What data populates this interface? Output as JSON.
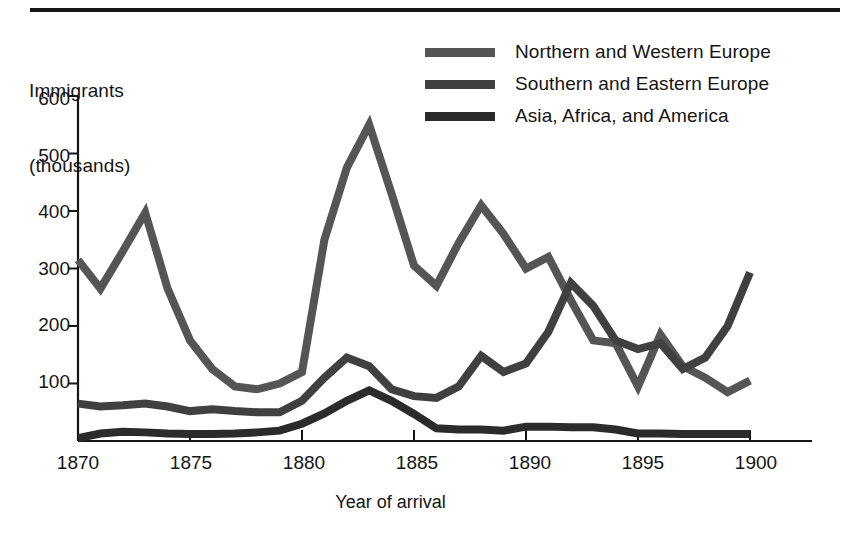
{
  "figure": {
    "y_axis_title_line1": "Immigrants",
    "y_axis_title_line2": "(thousands)",
    "x_axis_title": "Year of arrival",
    "ink_color": "#303030",
    "axis_color": "#151515"
  },
  "legend": {
    "position": "top-right",
    "entries": [
      {
        "label": "Northern and Western Europe",
        "color": "#555555"
      },
      {
        "label": "Southern and Eastern Europe",
        "color": "#404040"
      },
      {
        "label": "Asia, Africa, and America",
        "color": "#2b2b2b"
      }
    ]
  },
  "axes": {
    "y_ticks": [
      "600",
      "500",
      "400",
      "300",
      "200",
      "100"
    ],
    "x_ticks": [
      "1870",
      "1875",
      "1880",
      "1885",
      "1890",
      "1895",
      "1900"
    ]
  },
  "chart_data": {
    "type": "line",
    "title": "",
    "xlabel": "Year of arrival",
    "ylabel": "Immigrants (thousands)",
    "xlim": [
      1870,
      1900
    ],
    "ylim": [
      0,
      600
    ],
    "grid": false,
    "legend_position": "top-right",
    "x": [
      1870,
      1871,
      1872,
      1873,
      1874,
      1875,
      1876,
      1877,
      1878,
      1879,
      1880,
      1881,
      1882,
      1883,
      1884,
      1885,
      1886,
      1887,
      1888,
      1889,
      1890,
      1891,
      1892,
      1893,
      1894,
      1895,
      1896,
      1897,
      1898,
      1899,
      1900
    ],
    "series": [
      {
        "name": "Northern and Western Europe",
        "color": "#555555",
        "values": [
          315,
          265,
          330,
          397,
          265,
          175,
          125,
          95,
          90,
          100,
          120,
          350,
          475,
          550,
          430,
          305,
          270,
          345,
          410,
          360,
          300,
          320,
          245,
          175,
          170,
          95,
          185,
          130,
          110,
          85,
          105
        ]
      },
      {
        "name": "Southern and Eastern Europe",
        "color": "#404040",
        "values": [
          65,
          60,
          62,
          65,
          60,
          52,
          55,
          52,
          50,
          50,
          70,
          110,
          145,
          130,
          90,
          78,
          75,
          95,
          148,
          120,
          135,
          190,
          275,
          235,
          175,
          160,
          170,
          125,
          145,
          200,
          293
        ]
      },
      {
        "name": "Asia, Africa, and America",
        "color": "#2b2b2b",
        "values": [
          5,
          13,
          16,
          15,
          13,
          12,
          12,
          13,
          15,
          18,
          30,
          48,
          70,
          88,
          70,
          47,
          22,
          20,
          20,
          18,
          25,
          25,
          24,
          24,
          20,
          13,
          13,
          12,
          12,
          12,
          12
        ]
      }
    ]
  }
}
